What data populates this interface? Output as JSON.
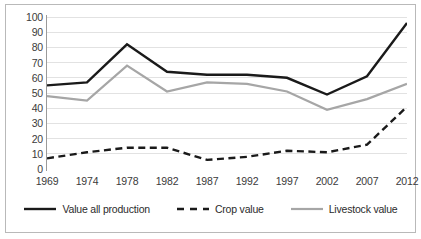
{
  "chart_data": {
    "type": "line",
    "title": "",
    "xlabel": "",
    "ylabel": "",
    "x": [
      "1969",
      "1974",
      "1978",
      "1982",
      "1987",
      "1992",
      "1997",
      "2002",
      "2007",
      "2012"
    ],
    "categories": [
      "1969",
      "1974",
      "1978",
      "1982",
      "1987",
      "1992",
      "1997",
      "2002",
      "2007",
      "2012"
    ],
    "ylim": [
      0,
      100
    ],
    "yticks": [
      0,
      10,
      20,
      30,
      40,
      50,
      60,
      70,
      80,
      90,
      100
    ],
    "grid": "horizontal",
    "legend_position": "bottom",
    "series": [
      {
        "name": "Value all production",
        "style": "solid",
        "color": "#1a1a1a",
        "width": 2.4,
        "values": [
          55,
          57,
          82,
          64,
          62,
          62,
          60,
          49,
          61,
          96
        ]
      },
      {
        "name": "Crop value",
        "style": "dashed",
        "color": "#1a1a1a",
        "width": 2.4,
        "values": [
          7,
          11,
          14,
          14,
          6,
          8,
          12,
          11,
          16,
          41
        ]
      },
      {
        "name": "Livestock value",
        "style": "solid",
        "color": "#a6a6a6",
        "width": 2.2,
        "values": [
          48,
          45,
          68,
          51,
          57,
          56,
          51,
          39,
          46,
          56
        ]
      }
    ]
  },
  "axes": {
    "y_tick_labels": [
      "100",
      "90",
      "80",
      "70",
      "60",
      "50",
      "40",
      "30",
      "20",
      "10",
      "0"
    ],
    "x_tick_labels": [
      "1969",
      "1974",
      "1978",
      "1982",
      "1987",
      "1992",
      "1997",
      "2002",
      "2007",
      "2012"
    ]
  },
  "legend": {
    "items": [
      {
        "label": "Value all production",
        "icon": "solid-line-swatch"
      },
      {
        "label": "Crop value",
        "icon": "dashed-line-swatch"
      },
      {
        "label": "Livestock value",
        "icon": "gray-solid-line-swatch"
      }
    ]
  },
  "colors": {
    "grid": "#e2e2e2",
    "axis": "#9a9a9a",
    "border": "#b9b9b9",
    "background": "#ffffff",
    "text": "#3b3b3b"
  }
}
